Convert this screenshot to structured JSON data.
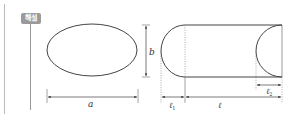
{
  "badge": {
    "label": "해설",
    "color": "#9a9a9a"
  },
  "diagram": {
    "ellipse": {
      "width_label": "a",
      "height_label": "b"
    },
    "capsule": {
      "left_cap_label": "ℓ",
      "left_cap_subscript": "1",
      "body_label": "ℓ",
      "right_cut_label": "ℓ",
      "right_cut_subscript": "2"
    },
    "colors": {
      "stroke": "#444444",
      "guide": "#888888",
      "margin_line": "#bbbbbb"
    }
  }
}
